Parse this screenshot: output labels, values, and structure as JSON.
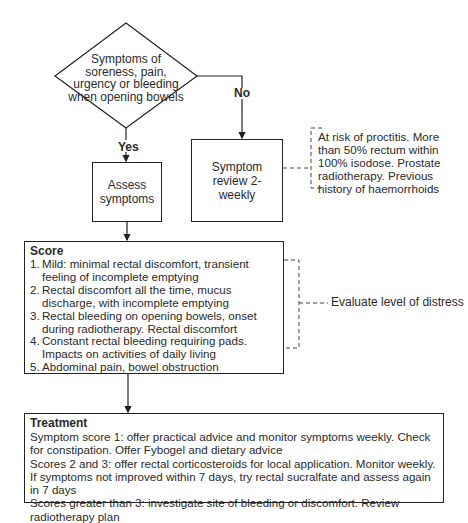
{
  "decision": {
    "text": "Symptoms of soreness, pain, urgency or bleeding when opening bowels",
    "yes_label": "Yes",
    "no_label": "No"
  },
  "assess_box": {
    "text": "Assess symptoms"
  },
  "review_box": {
    "text": "Symptom review 2-weekly"
  },
  "risk_note": {
    "text": "At risk of proctitis. More than 50% rectum within 100% isodose. Prostate radiotherapy. Previous history of haemorrhoids"
  },
  "score_panel": {
    "title": "Score",
    "items": [
      {
        "num": "1.",
        "text": "Mild: minimal rectal discomfort, transient feeling of incomplete emptying"
      },
      {
        "num": "2.",
        "text": "Rectal discomfort all the time, mucus discharge, with incomplete emptying"
      },
      {
        "num": "3.",
        "text": "Rectal bleeding on opening bowels, onset during radiotherapy. Rectal discomfort"
      },
      {
        "num": "4.",
        "text": "Constant rectal bleeding requiring pads. Impacts on activities of daily living"
      },
      {
        "num": "5.",
        "text": "Abdominal pain, bowel obstruction"
      }
    ]
  },
  "distress_note": {
    "text": "Evaluate level of distress"
  },
  "treatment_panel": {
    "title": "Treatment",
    "lines": [
      "Symptom score 1: offer practical advice and monitor symptoms weekly. Check for constipation. Offer Fybogel and dietary advice",
      "Scores 2 and 3: offer rectal corticosteroids for local application. Monitor weekly. If symptoms not improved within 7 days, try rectal sucralfate and assess again in 7 days",
      "Scores greater than 3: investigate site of bleeding or discomfort. Review radiotherapy plan"
    ]
  },
  "colors": {
    "line": "#222222",
    "text": "#2a2a2a",
    "background": "#ffffff"
  }
}
